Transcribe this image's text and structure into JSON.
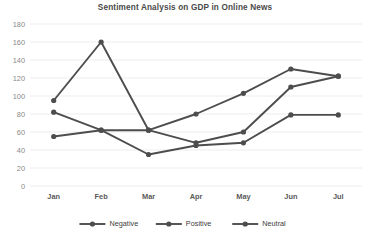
{
  "chart_data": {
    "type": "line",
    "title": "Sentiment Analysis on GDP in Online News",
    "xlabel": "",
    "ylabel": "",
    "categories": [
      "Jan",
      "Feb",
      "Mar",
      "Apr",
      "May",
      "Jun",
      "Jul"
    ],
    "series": [
      {
        "name": "Negative",
        "values": [
          95,
          160,
          62,
          48,
          60,
          110,
          122
        ]
      },
      {
        "name": "Positive",
        "values": [
          82,
          62,
          62,
          80,
          103,
          130,
          122
        ]
      },
      {
        "name": "Neutral",
        "values": [
          55,
          62,
          35,
          45,
          48,
          79,
          79
        ]
      }
    ],
    "ylim": [
      0,
      180
    ],
    "ytick_step": 20,
    "yticks": [
      0,
      20,
      40,
      60,
      80,
      100,
      120,
      140,
      160,
      180
    ],
    "grid": true,
    "legend_position": "bottom",
    "line_color": "#4d4d4d",
    "grid_color": "#e9e9e9",
    "title_color": "#4a4a4a",
    "background": "#ffffff"
  }
}
